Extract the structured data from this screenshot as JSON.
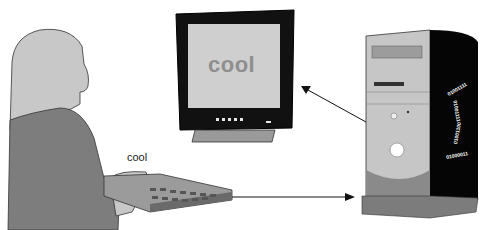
{
  "diagram": {
    "typed_word": "cool",
    "screen_word": "cool",
    "binary_ring": [
      "01001111",
      "01001111",
      "01001100",
      "01000011"
    ],
    "nodes": [
      {
        "id": "user",
        "label": "person at keyboard"
      },
      {
        "id": "keyboard",
        "label": "keyboard"
      },
      {
        "id": "monitor",
        "label": "monitor"
      },
      {
        "id": "tower",
        "label": "computer tower"
      }
    ],
    "edges": [
      {
        "from": "keyboard",
        "to": "tower"
      },
      {
        "from": "tower",
        "to": "monitor"
      }
    ],
    "colors": {
      "skin": "#c8c8c8",
      "shirt": "#7d7d7d",
      "screen": "#cfcfcf",
      "bezel": "#111111",
      "tower_front": "#c6c6c6",
      "tower_side": "#050505",
      "arrow": "#111111"
    }
  }
}
